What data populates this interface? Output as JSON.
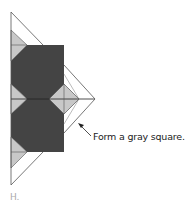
{
  "diagram": {
    "type": "origami-fold-step",
    "step_label": "H.",
    "annotation": "Form a gray square.",
    "colors": {
      "dark": "#444444",
      "light_gray": "#c8c8c8",
      "line": "#555555",
      "background": "#ffffff"
    }
  }
}
